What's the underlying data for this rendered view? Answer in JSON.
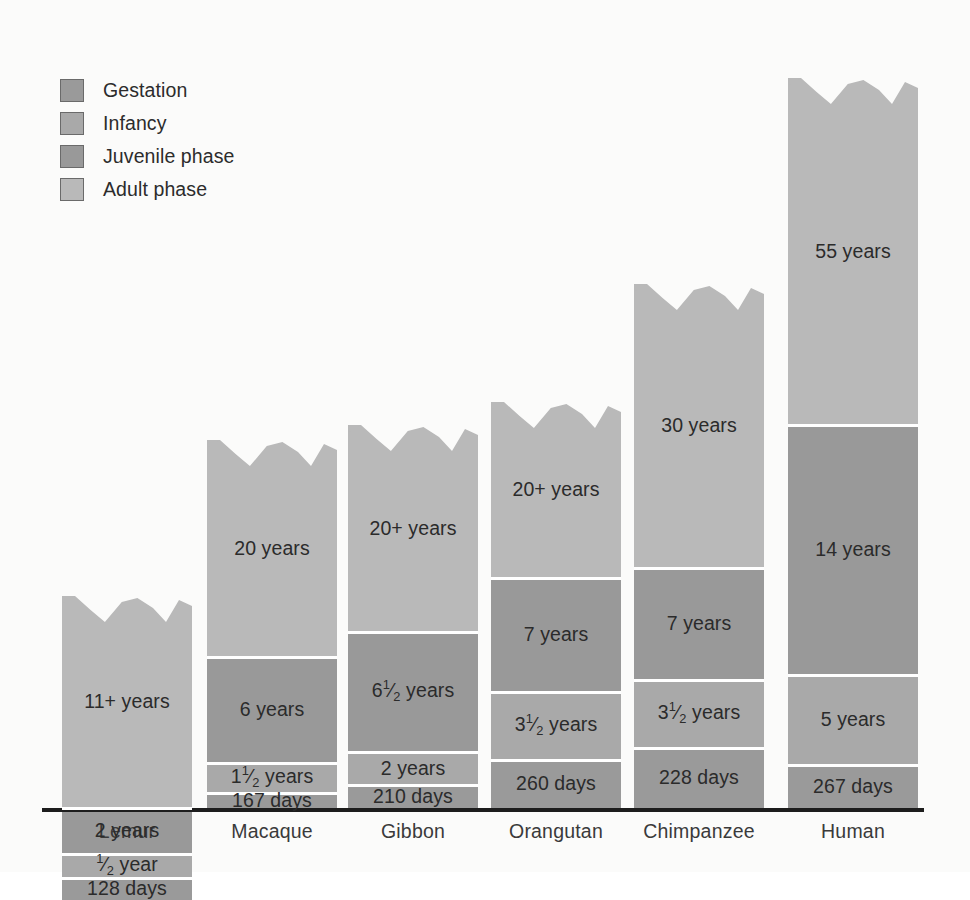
{
  "legend": {
    "items": [
      {
        "label": "Gestation",
        "color": "#9a9a9a"
      },
      {
        "label": "Infancy",
        "color": "#a9a9a9"
      },
      {
        "label": "Juvenile phase",
        "color": "#999999"
      },
      {
        "label": "Adult phase",
        "color": "#b9b9b9"
      }
    ]
  },
  "axis": {
    "categories": [
      "Lemur",
      "Macaque",
      "Gibbon",
      "Orangutan",
      "Chimpanzee",
      "Human"
    ]
  },
  "colors": {
    "gestation": "#9a9a9a",
    "infancy": "#a9a9a9",
    "juvenile": "#999999",
    "adult": "#b9b9b9",
    "background": "#fbfbfa",
    "axis": "#1d1d1d",
    "divider": "#ffffff",
    "text": "#2b2b2b"
  },
  "chart_data": {
    "type": "bar",
    "stacked": true,
    "title": "",
    "xlabel": "",
    "ylabel": "",
    "grid": false,
    "legend_position": "top-left",
    "categories": [
      "Lemur",
      "Macaque",
      "Gibbon",
      "Orangutan",
      "Chimpanzee",
      "Human"
    ],
    "series": [
      {
        "name": "Gestation",
        "color": "#9a9a9a",
        "labels": [
          "128 days",
          "167 days",
          "210 days",
          "260 days",
          "228 days",
          "267 days"
        ],
        "values_days": [
          128,
          167,
          210,
          260,
          228,
          267
        ],
        "pixel_heights": [
          22,
          16,
          24,
          48,
          60,
          43
        ]
      },
      {
        "name": "Infancy",
        "color": "#a9a9a9",
        "labels": [
          "1/2 year",
          "1 1/2 years",
          "2 years",
          "3 1/2 years",
          "3 1/2 years",
          "5 years"
        ],
        "values_years": [
          0.5,
          1.5,
          2,
          3.5,
          3.5,
          5
        ],
        "pixel_heights": [
          24,
          30,
          33,
          68,
          68,
          90
        ]
      },
      {
        "name": "Juvenile phase",
        "color": "#999999",
        "labels": [
          "2 years",
          "6 years",
          "6 1/2 years",
          "7 years",
          "7 years",
          "14 years"
        ],
        "values_years": [
          2,
          6,
          6.5,
          7,
          7,
          14
        ],
        "pixel_heights": [
          46,
          106,
          120,
          114,
          112,
          250
        ]
      },
      {
        "name": "Adult phase",
        "color": "#b9b9b9",
        "labels": [
          "11+ years",
          "20 years",
          "20+ years",
          "20+ years",
          "30 years",
          "55 years"
        ],
        "values_years": [
          11,
          20,
          20,
          20,
          30,
          55
        ],
        "pixel_heights": [
          212,
          217,
          207,
          176,
          284,
          347
        ]
      }
    ],
    "bar_tops_y": [
      596,
      440,
      425,
      402,
      284,
      78
    ],
    "bar_x_positions": [
      62,
      207,
      348,
      491,
      634,
      788
    ],
    "bar_width": 130,
    "baseline_y": 808
  },
  "bars": [
    {
      "name": "Lemur",
      "x": 62,
      "width": 130,
      "top": 596,
      "segments": [
        {
          "phase": "adult",
          "label": "11+ years",
          "height": 212
        },
        {
          "phase": "juvenile",
          "label": "2 years",
          "height": 46
        },
        {
          "phase": "infancy",
          "label": "½ year",
          "height": 24
        },
        {
          "phase": "gestation",
          "label": "128 days",
          "height": 22
        }
      ]
    },
    {
      "name": "Macaque",
      "x": 207,
      "width": 130,
      "top": 440,
      "segments": [
        {
          "phase": "adult",
          "label": "20 years",
          "height": 217
        },
        {
          "phase": "juvenile",
          "label": "6 years",
          "height": 106
        },
        {
          "phase": "infancy",
          "label": "1½ years",
          "height": 30
        },
        {
          "phase": "gestation",
          "label": "167 days",
          "height": 16
        }
      ]
    },
    {
      "name": "Gibbon",
      "x": 348,
      "width": 130,
      "top": 425,
      "segments": [
        {
          "phase": "adult",
          "label": "20+ years",
          "height": 207
        },
        {
          "phase": "juvenile",
          "label": "6½ years",
          "height": 120
        },
        {
          "phase": "infancy",
          "label": "2 years",
          "height": 33
        },
        {
          "phase": "gestation",
          "label": "210 days",
          "height": 24
        }
      ]
    },
    {
      "name": "Orangutan",
      "x": 491,
      "width": 130,
      "top": 402,
      "segments": [
        {
          "phase": "adult",
          "label": "20+ years",
          "height": 176
        },
        {
          "phase": "juvenile",
          "label": "7 years",
          "height": 114
        },
        {
          "phase": "infancy",
          "label": "3½ years",
          "height": 68
        },
        {
          "phase": "gestation",
          "label": "260 days",
          "height": 48
        }
      ]
    },
    {
      "name": "Chimpanzee",
      "x": 634,
      "width": 130,
      "top": 284,
      "segments": [
        {
          "phase": "adult",
          "label": "30 years",
          "height": 284
        },
        {
          "phase": "juvenile",
          "label": "7 years",
          "height": 112
        },
        {
          "phase": "infancy",
          "label": "3½ years",
          "height": 68
        },
        {
          "phase": "gestation",
          "label": "228 days",
          "height": 60
        }
      ]
    },
    {
      "name": "Human",
      "x": 788,
      "width": 130,
      "top": 78,
      "segments": [
        {
          "phase": "adult",
          "label": "55 years",
          "height": 347
        },
        {
          "phase": "juvenile",
          "label": "14 years",
          "height": 250
        },
        {
          "phase": "infancy",
          "label": "5 years",
          "height": 90
        },
        {
          "phase": "gestation",
          "label": "267 days",
          "height": 43
        }
      ]
    }
  ]
}
